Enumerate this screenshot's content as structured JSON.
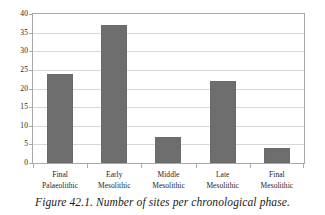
{
  "caption": "Figure 42.1. Number of sites per chronological phase.",
  "style": {
    "bar_color": "#6e6e6e",
    "gridline_color": "#d8d8d8",
    "axis_color": "#a9a9a9",
    "background": "#ffffff",
    "text_color": "#1d1d1d"
  },
  "chart_data": {
    "type": "bar",
    "title": "",
    "subtitle": "",
    "xlabel": "",
    "ylabel": "",
    "categories": [
      "Final Palaeolithic",
      "Early Mesolithic",
      "Middle Mesolithic",
      "Late Mesolithic",
      "Final Mesolithic"
    ],
    "category_lines": [
      [
        "Final",
        "Palaeolithic"
      ],
      [
        "Early",
        "Mesolithic"
      ],
      [
        "Middle",
        "Mesolithic"
      ],
      [
        "Late",
        "Mesolithic"
      ],
      [
        "Final",
        "Mesolithic"
      ]
    ],
    "values": [
      24,
      37,
      7,
      22,
      4
    ],
    "ylim": [
      0,
      40
    ],
    "ytick_step": 5,
    "yticks": [
      0,
      5,
      10,
      15,
      20,
      25,
      30,
      35,
      40
    ],
    "ytick_labels": [
      "0",
      "5",
      "10",
      "15",
      "20",
      "25",
      "30",
      "35",
      "40"
    ],
    "grid": true,
    "grid_axis": "y",
    "legend": false,
    "legend_position": "none"
  }
}
